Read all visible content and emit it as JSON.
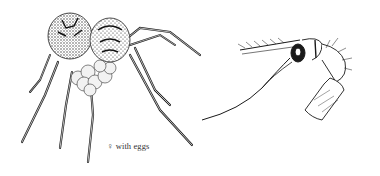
{
  "figure": {
    "caption": "♀ with eggs",
    "subjects": [
      "spider-female-with-egg-sac",
      "pedipalp-detail"
    ],
    "colors": {
      "ink": "#1a1a1a",
      "background": "#ffffff",
      "egg": "#e8e8e8"
    }
  }
}
